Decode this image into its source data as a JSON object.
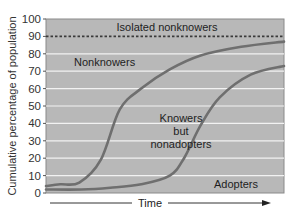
{
  "chart_data": {
    "type": "line",
    "title": "",
    "xlabel": "Time",
    "ylabel": "Cumulative percentage of population",
    "ylim": [
      0,
      100
    ],
    "xlim": [
      0,
      100
    ],
    "yticks": [
      0,
      10,
      20,
      30,
      40,
      50,
      60,
      70,
      80,
      90,
      100
    ],
    "x_ticks_shown": false,
    "x_axis_note": "Time axis unlabeled; arrow indicates direction",
    "grid": true,
    "legend": "none (regions labeled directly)",
    "reference_lines": [
      {
        "name": "isolated-nonknowers-threshold",
        "y": 90,
        "style": "dotted"
      }
    ],
    "series": [
      {
        "name": "Knowers (awareness)",
        "x": [
          0,
          6,
          14,
          23,
          31,
          40,
          52,
          65,
          82,
          100
        ],
        "values": [
          4,
          5,
          6,
          19,
          48,
          60,
          71,
          79,
          84,
          87
        ]
      },
      {
        "name": "Adopters",
        "x": [
          0,
          15,
          27,
          40,
          52,
          58,
          65,
          73,
          86,
          100
        ],
        "values": [
          2,
          2,
          3,
          5,
          10,
          20,
          39,
          55,
          68,
          73
        ]
      }
    ],
    "region_labels": [
      {
        "text": "Isolated nonknowers",
        "x": 52,
        "y": 95
      },
      {
        "text": "Nonknowers",
        "x": 17,
        "y": 75
      },
      {
        "text": "Knowers",
        "x": 55,
        "y": 43
      },
      {
        "text": "but",
        "x": 55,
        "y": 36
      },
      {
        "text": "nonadopters",
        "x": 55,
        "y": 29
      },
      {
        "text": "Adopters",
        "x": 88,
        "y": 5
      }
    ],
    "colors": {
      "plot_background": "#b8b8b8",
      "gridline": "#f2f2f2",
      "curve": "#6f6f6f",
      "reference_line": "#3a3a3a",
      "frame": "#8a8a8a"
    }
  },
  "labels": {
    "ylabel": "Cumulative percentage of population",
    "xlabel": "Time",
    "region_isolated": "Isolated nonknowers",
    "region_nonknowers": "Nonknowers",
    "region_knowers_1": "Knowers",
    "region_knowers_2": "but",
    "region_knowers_3": "nonadopters",
    "region_adopters": "Adopters"
  }
}
